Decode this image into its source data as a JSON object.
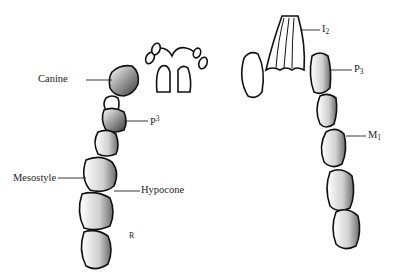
{
  "figure": {
    "upper_jaw": {
      "labels": [
        {
          "id": "canine",
          "text": "Canine"
        },
        {
          "id": "p3",
          "base": "P",
          "sup": "3"
        },
        {
          "id": "mesostyle",
          "text": "Mesostyle"
        },
        {
          "id": "hypocone",
          "text": "Hypocone"
        }
      ],
      "mark": "R"
    },
    "lower_jaw": {
      "labels": [
        {
          "id": "i2",
          "base": "I",
          "sub": "2"
        },
        {
          "id": "p3",
          "base": "P",
          "sub": "3"
        },
        {
          "id": "m1",
          "base": "M",
          "sub": "1"
        }
      ]
    },
    "colors": {
      "line": "#111111",
      "shade": "#555555",
      "background": "#ffffff"
    }
  }
}
